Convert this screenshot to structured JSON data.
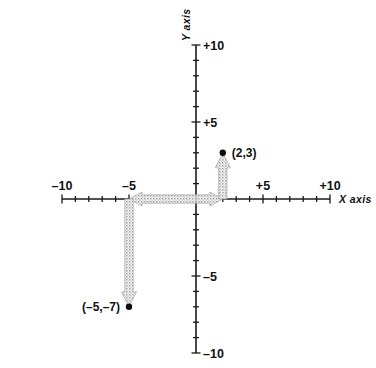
{
  "figure": {
    "kind": "cartesian-coordinate-plane",
    "background_color": "#ffffff",
    "ink_color": "#111111",
    "arrow_color": "#9a9a9a"
  },
  "axes": {
    "x": {
      "name": "X axis",
      "min": -10,
      "max": 10,
      "labels": [
        {
          "value": -10,
          "text": "–10"
        },
        {
          "value": -5,
          "text": "–5"
        },
        {
          "value": 5,
          "text": "+5"
        },
        {
          "value": 10,
          "text": "+10"
        }
      ],
      "tick_step": 1
    },
    "y": {
      "name": "Y axis",
      "min": -10,
      "max": 10,
      "labels": [
        {
          "value": 10,
          "text": "+10"
        },
        {
          "value": 5,
          "text": "+5"
        },
        {
          "value": -5,
          "text": "–5"
        },
        {
          "value": -10,
          "text": "–10"
        }
      ],
      "tick_step": 1
    }
  },
  "chart_data": {
    "type": "scatter",
    "title": "",
    "xlabel": "X axis",
    "ylabel": "Y axis",
    "xlim": [
      -10,
      10
    ],
    "ylim": [
      -10,
      10
    ],
    "grid": false,
    "legend": "none",
    "x_tick_labels": [
      "–10",
      "–5",
      "+5",
      "+10"
    ],
    "y_tick_labels": [
      "+10",
      "+5",
      "–5",
      "–10"
    ],
    "points": [
      {
        "label": "(2,3)",
        "x": 2,
        "y": 3,
        "label_position": "right"
      },
      {
        "label": "(–5,–7)",
        "x": -5,
        "y": -7,
        "label_position": "left"
      }
    ],
    "annotations": [
      {
        "kind": "arrow",
        "from": [
          0,
          0
        ],
        "to": [
          2,
          0
        ],
        "orientation": "horizontal",
        "style": "stippled"
      },
      {
        "kind": "arrow",
        "from": [
          2,
          0
        ],
        "to": [
          2,
          3
        ],
        "orientation": "vertical",
        "style": "stippled"
      },
      {
        "kind": "arrow",
        "from": [
          0,
          0
        ],
        "to": [
          -5,
          0
        ],
        "orientation": "horizontal",
        "style": "stippled"
      },
      {
        "kind": "arrow",
        "from": [
          -5,
          0
        ],
        "to": [
          -5,
          -7
        ],
        "orientation": "vertical",
        "style": "stippled"
      }
    ]
  }
}
